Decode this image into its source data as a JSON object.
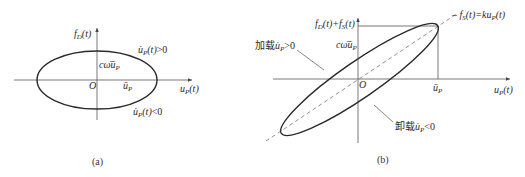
{
  "figure_a": {
    "caption": "(a)",
    "y_axis_label": "f_D(t)",
    "x_axis_label": "u_P(t)",
    "origin_label": "O",
    "amplitude_label": "ū_P",
    "intercept_label": "cω̄ū_P",
    "upper_branch_label": "u̇_P(t)>0",
    "lower_branch_label": "u̇_P(t)<0"
  },
  "figure_b": {
    "caption": "(b)",
    "y_axis_label": "f_D(t)+f_S(t)",
    "x_axis_label": "u_P(t)",
    "origin_label": "O",
    "amplitude_label": "ū_P",
    "intercept_label": "cω̄ū_P",
    "dashed_line_label": "f_S(t)=ku_P(t)",
    "loading_label": "加载u̇_P>0",
    "unloading_label": "卸载u̇_P<0"
  },
  "colors": {
    "line": "#2a2a2a",
    "axis": "#555555",
    "dashed": "#777777"
  }
}
